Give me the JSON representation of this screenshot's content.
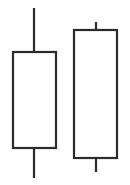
{
  "figure": {
    "title": "",
    "background_color": "#ffffff",
    "width": 130,
    "height": 185
  },
  "chart_data": {
    "type": "candlestick",
    "title": "",
    "subtitle": "",
    "xlabel": "",
    "ylabel": "",
    "axis_visible": false,
    "grid": false,
    "legend": false,
    "legend_position": "none",
    "axis_orientation": "price-vertical-higher-is-up",
    "xlim": [
      0,
      2
    ],
    "ylim": [
      0,
      185
    ],
    "note": "Two hollow (white-filled) candlesticks drawn as outlines with vertical wicks. Pixel y increases downward; price values below are given as pixel coordinates of the drawn geometry.",
    "categories": [
      "Candle 1",
      "Candle 2"
    ],
    "candles": [
      {
        "index": 0,
        "label": "Candle 1",
        "body_fill": "#ffffff",
        "outline_color": "#2b2b2b",
        "body_left_px": 13,
        "body_right_px": 56,
        "body_top_px": 52,
        "body_bottom_px": 148,
        "wick_x_px": 34,
        "wick_top_px": 8,
        "wick_bottom_px": 178,
        "upper_shadow_length_px": 44,
        "lower_shadow_length_px": 30,
        "body_height_px": 96,
        "body_width_px": 43
      },
      {
        "index": 1,
        "label": "Candle 2",
        "body_fill": "#ffffff",
        "outline_color": "#2b2b2b",
        "body_left_px": 74,
        "body_right_px": 117,
        "body_top_px": 30,
        "body_bottom_px": 158,
        "wick_x_px": 96,
        "wick_top_px": 22,
        "wick_bottom_px": 172,
        "upper_shadow_length_px": 8,
        "lower_shadow_length_px": 14,
        "body_height_px": 128,
        "body_width_px": 43
      }
    ],
    "style": {
      "stroke_color": "#2b2b2b",
      "body_stroke_width": 2.2,
      "wick_stroke_width": 2.2,
      "fill_color": "#ffffff"
    }
  }
}
